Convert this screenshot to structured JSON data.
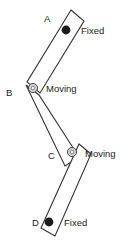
{
  "diagram": {
    "background_color": "#ffffff",
    "stroke_color": "#333333",
    "fixed_joint_color": "#1b1b1b",
    "moving_joint_color": "#cfcfcf",
    "points": [
      {
        "id": "A",
        "label": "A",
        "label_x": 44,
        "label_y": 22,
        "joint_x": 66,
        "joint_y": 30,
        "joint_type": "fixed",
        "state_label": "Fixed",
        "state_x": 81,
        "state_y": 34
      },
      {
        "id": "B",
        "label": "B",
        "label_x": 6,
        "label_y": 96,
        "joint_x": 33,
        "joint_y": 88,
        "joint_type": "moving",
        "state_label": "Moving",
        "state_x": 46,
        "state_y": 92
      },
      {
        "id": "C",
        "label": "C",
        "label_x": 48,
        "label_y": 159,
        "joint_x": 72,
        "joint_y": 152,
        "joint_type": "moving",
        "state_label": "Moving",
        "state_x": 85,
        "state_y": 157
      },
      {
        "id": "D",
        "label": "D",
        "label_x": 32,
        "label_y": 226,
        "joint_x": 49,
        "joint_y": 222,
        "joint_type": "fixed",
        "state_label": "Fixed",
        "state_x": 64,
        "state_y": 226
      }
    ],
    "links": [
      {
        "id": "link-ab",
        "name": "link-a-b",
        "points": "71,10 84,21 40,93 27,82"
      },
      {
        "id": "link-bc",
        "name": "link-b-c",
        "points": "26,85 39,95 79,157 65,166"
      },
      {
        "id": "link-cd",
        "name": "link-c-d",
        "points": "79,144 91,154 55,236 41,228"
      }
    ]
  }
}
